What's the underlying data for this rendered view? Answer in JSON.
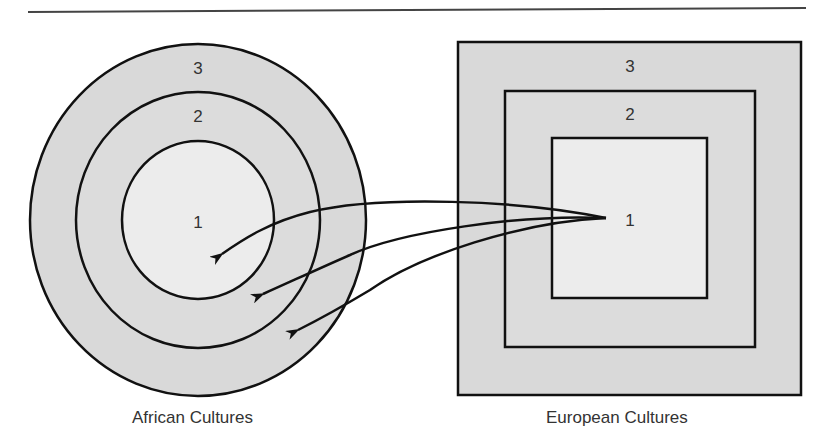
{
  "figure": {
    "colors": {
      "outline": "#111111",
      "outer_fill": "#d9d9d9",
      "middle_fill": "#dcdcdc",
      "inner_fill": "#ececec",
      "text": "#333333"
    },
    "african": {
      "caption": "African Cultures",
      "shape": "concentric-circles",
      "rings": [
        {
          "label": "3"
        },
        {
          "label": "2"
        },
        {
          "label": "1"
        }
      ]
    },
    "european": {
      "caption": "European Cultures",
      "shape": "concentric-squares",
      "rings": [
        {
          "label": "3"
        },
        {
          "label": "2"
        },
        {
          "label": "1"
        }
      ]
    },
    "arrows": [
      {
        "from": "european.1",
        "to": "african.1"
      },
      {
        "from": "european.1",
        "to": "african.2"
      },
      {
        "from": "european.1",
        "to": "african.3"
      }
    ]
  }
}
